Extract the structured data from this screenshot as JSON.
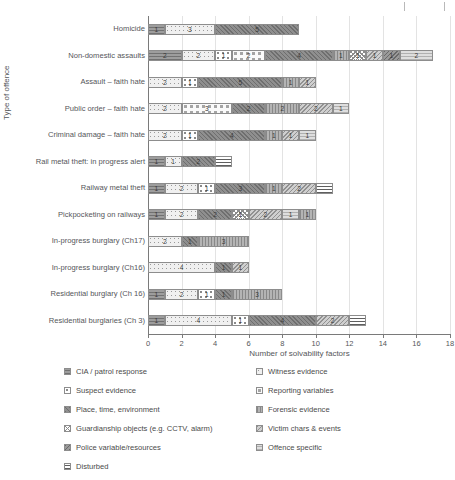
{
  "chart_data": {
    "type": "bar",
    "orientation": "horizontal",
    "stacked": true,
    "title": "",
    "xlabel": "Number of solvability factors",
    "ylabel": "Type of offence",
    "xlim": [
      0,
      18
    ],
    "xticks": [
      0,
      2,
      4,
      6,
      8,
      10,
      12,
      14,
      16,
      18
    ],
    "grid": true,
    "legend_position": "bottom",
    "categories": [
      "Homicide",
      "Non-domestic assaults",
      "Assault – faith hate",
      "Public order – faith hate",
      "Criminal damage – faith hate",
      "Rail metal theft: in progress alert",
      "Railway metal theft",
      "Pickpocketing on railways",
      "In-progress burglary (Ch17)",
      "In-progress burglary (Ch16)",
      "Residential burglary (Ch 16)",
      "Residential burglaries (Ch 3)"
    ],
    "series": [
      {
        "name": "CIA / patrol response",
        "values": [
          1,
          2,
          0,
          0,
          0,
          1,
          1,
          1,
          0,
          0,
          1,
          1
        ]
      },
      {
        "name": "Witness evidence",
        "values": [
          3,
          2,
          2,
          2,
          2,
          1,
          2,
          2,
          2,
          4,
          2,
          4
        ]
      },
      {
        "name": "Suspect evidence",
        "values": [
          0,
          1,
          1,
          0,
          1,
          0,
          1,
          0,
          0,
          0,
          1,
          1
        ]
      },
      {
        "name": "Reporting variables",
        "values": [
          0,
          2,
          0,
          3,
          0,
          0,
          0,
          0,
          0,
          0,
          0,
          0
        ]
      },
      {
        "name": "Place, time, environment",
        "values": [
          5,
          4,
          5,
          2,
          4,
          2,
          3,
          2,
          1,
          1,
          1,
          4
        ]
      },
      {
        "name": "Forensic evidence",
        "values": [
          0,
          1,
          1,
          2,
          1,
          0,
          1,
          1,
          3,
          0,
          3,
          0
        ]
      },
      {
        "name": "Guardianship objects (e.g. CCTV, alarm)",
        "values": [
          0,
          1,
          0,
          0,
          0,
          0,
          0,
          1,
          0,
          0,
          0,
          0
        ]
      },
      {
        "name": "Victim chars & events",
        "values": [
          0,
          1,
          1,
          2,
          1,
          0,
          2,
          2,
          0,
          1,
          0,
          2
        ]
      },
      {
        "name": "Police variable/resources",
        "values": [
          0,
          1,
          0,
          0,
          0,
          0,
          0,
          0,
          0,
          0,
          0,
          0
        ]
      },
      {
        "name": "Offence specific",
        "values": [
          0,
          2,
          0,
          1,
          1,
          0,
          0,
          1,
          0,
          0,
          0,
          0
        ]
      },
      {
        "name": "Disturbed",
        "values": [
          0,
          0,
          0,
          0,
          0,
          1,
          1,
          0,
          0,
          0,
          0,
          1
        ]
      }
    ],
    "bar_totals": [
      9,
      17,
      10,
      12,
      10,
      5,
      11,
      10,
      6,
      6,
      8,
      13
    ],
    "bars": [
      {
        "category": "Homicide",
        "segments": [
          {
            "series": "CIA / patrol response",
            "value": 1,
            "label": "1"
          },
          {
            "series": "Witness evidence",
            "value": 3,
            "label": "3"
          },
          {
            "series": "Place, time, environment",
            "value": 5,
            "label": "5"
          }
        ]
      },
      {
        "category": "Non-domestic assaults",
        "segments": [
          {
            "series": "CIA / patrol response",
            "value": 2,
            "label": "2"
          },
          {
            "series": "Witness evidence",
            "value": 2,
            "label": "2"
          },
          {
            "series": "Suspect evidence",
            "value": 1,
            "label": "1"
          },
          {
            "series": "Reporting variables",
            "value": 2,
            "label": "2"
          },
          {
            "series": "Place, time, environment",
            "value": 4,
            "label": "4"
          },
          {
            "series": "Forensic evidence",
            "value": 1,
            "label": "1"
          },
          {
            "series": "Guardianship objects (e.g. CCTV, alarm)",
            "value": 1,
            "label": "1"
          },
          {
            "series": "Victim chars & events",
            "value": 1,
            "label": "1"
          },
          {
            "series": "Police variable/resources",
            "value": 1,
            "label": "1"
          },
          {
            "series": "Offence specific",
            "value": 2,
            "label": "2"
          }
        ]
      },
      {
        "category": "Assault – faith hate",
        "segments": [
          {
            "series": "Witness evidence",
            "value": 2,
            "label": "2"
          },
          {
            "series": "Suspect evidence",
            "value": 1,
            "label": "1"
          },
          {
            "series": "Place, time, environment",
            "value": 5,
            "label": "5"
          },
          {
            "series": "Forensic evidence",
            "value": 1,
            "label": "1"
          },
          {
            "series": "Victim chars & events",
            "value": 1,
            "label": "1"
          }
        ]
      },
      {
        "category": "Public order – faith hate",
        "segments": [
          {
            "series": "Witness evidence",
            "value": 2,
            "label": "2"
          },
          {
            "series": "Reporting variables",
            "value": 3,
            "label": "3"
          },
          {
            "series": "Place, time, environment",
            "value": 2,
            "label": "2"
          },
          {
            "series": "Forensic evidence",
            "value": 2,
            "label": "2"
          },
          {
            "series": "Victim chars & events",
            "value": 2,
            "label": "2"
          },
          {
            "series": "Offence specific",
            "value": 1,
            "label": "1"
          }
        ]
      },
      {
        "category": "Criminal damage – faith hate",
        "segments": [
          {
            "series": "Witness evidence",
            "value": 2,
            "label": "2"
          },
          {
            "series": "Suspect evidence",
            "value": 1,
            "label": "1"
          },
          {
            "series": "Place, time, environment",
            "value": 4,
            "label": "4"
          },
          {
            "series": "Forensic evidence",
            "value": 1,
            "label": "1"
          },
          {
            "series": "Victim chars & events",
            "value": 1,
            "label": "1"
          },
          {
            "series": "Offence specific",
            "value": 1,
            "label": "1"
          }
        ]
      },
      {
        "category": "Rail metal theft: in progress alert",
        "segments": [
          {
            "series": "CIA / patrol response",
            "value": 1,
            "label": "1"
          },
          {
            "series": "Witness evidence",
            "value": 1,
            "label": "1"
          },
          {
            "series": "Place, time, environment",
            "value": 2,
            "label": "2"
          },
          {
            "series": "Disturbed",
            "value": 1,
            "label": ""
          }
        ]
      },
      {
        "category": "Railway metal theft",
        "segments": [
          {
            "series": "CIA / patrol response",
            "value": 1,
            "label": "1"
          },
          {
            "series": "Witness evidence",
            "value": 2,
            "label": "2"
          },
          {
            "series": "Suspect evidence",
            "value": 1,
            "label": "1"
          },
          {
            "series": "Place, time, environment",
            "value": 3,
            "label": "3"
          },
          {
            "series": "Forensic evidence",
            "value": 1,
            "label": "1"
          },
          {
            "series": "Victim chars & events",
            "value": 2,
            "label": "2"
          },
          {
            "series": "Disturbed",
            "value": 1,
            "label": ""
          }
        ]
      },
      {
        "category": "Pickpocketing on railways",
        "segments": [
          {
            "series": "CIA / patrol response",
            "value": 1,
            "label": "1"
          },
          {
            "series": "Witness evidence",
            "value": 2,
            "label": "2"
          },
          {
            "series": "Place, time, environment",
            "value": 2,
            "label": "2"
          },
          {
            "series": "Guardianship objects (e.g. CCTV, alarm)",
            "value": 1,
            "label": "1"
          },
          {
            "series": "Victim chars & events",
            "value": 2,
            "label": "2"
          },
          {
            "series": "Offence specific",
            "value": 1,
            "label": "1"
          },
          {
            "series": "Forensic evidence",
            "value": 1,
            "label": "1"
          }
        ]
      },
      {
        "category": "In-progress burglary (Ch17)",
        "segments": [
          {
            "series": "Witness evidence",
            "value": 2,
            "label": "2"
          },
          {
            "series": "Place, time, environment",
            "value": 1,
            "label": "1"
          },
          {
            "series": "Forensic evidence",
            "value": 3,
            "label": "3"
          }
        ]
      },
      {
        "category": "In-progress burglary (Ch16)",
        "segments": [
          {
            "series": "Witness evidence",
            "value": 4,
            "label": "4"
          },
          {
            "series": "Place, time, environment",
            "value": 1,
            "label": "1"
          },
          {
            "series": "Victim chars & events",
            "value": 1,
            "label": "1"
          }
        ]
      },
      {
        "category": "Residential burglary (Ch 16)",
        "segments": [
          {
            "series": "CIA / patrol response",
            "value": 1,
            "label": "1"
          },
          {
            "series": "Witness evidence",
            "value": 2,
            "label": "2"
          },
          {
            "series": "Suspect evidence",
            "value": 1,
            "label": "1"
          },
          {
            "series": "Place, time, environment",
            "value": 1,
            "label": "1"
          },
          {
            "series": "Forensic evidence",
            "value": 3,
            "label": "3"
          }
        ]
      },
      {
        "category": "Residential burglaries (Ch 3)",
        "segments": [
          {
            "series": "CIA / patrol response",
            "value": 1,
            "label": "1"
          },
          {
            "series": "Witness evidence",
            "value": 4,
            "label": "4"
          },
          {
            "series": "Suspect evidence",
            "value": 1,
            "label": "1"
          },
          {
            "series": "Place, time, environment",
            "value": 4,
            "label": "4"
          },
          {
            "series": "Victim chars & events",
            "value": 2,
            "label": "2"
          },
          {
            "series": "Disturbed",
            "value": 1,
            "label": ""
          }
        ]
      }
    ]
  },
  "legend": {
    "column1": [
      "CIA / patrol response",
      "Suspect evidence",
      "Place, time, environment",
      "Guardianship objects (e.g. CCTV, alarm)",
      "Police variable/resources",
      "Disturbed"
    ],
    "column2": [
      "Witness evidence",
      "Reporting variables",
      "Forensic evidence",
      "Victim chars & events",
      "Offence specific"
    ]
  },
  "colors": {
    "axis": "#7a7a7a",
    "grid": "#e3e3e3",
    "text": "#55565a",
    "segment_border": "#8d8d8d"
  }
}
